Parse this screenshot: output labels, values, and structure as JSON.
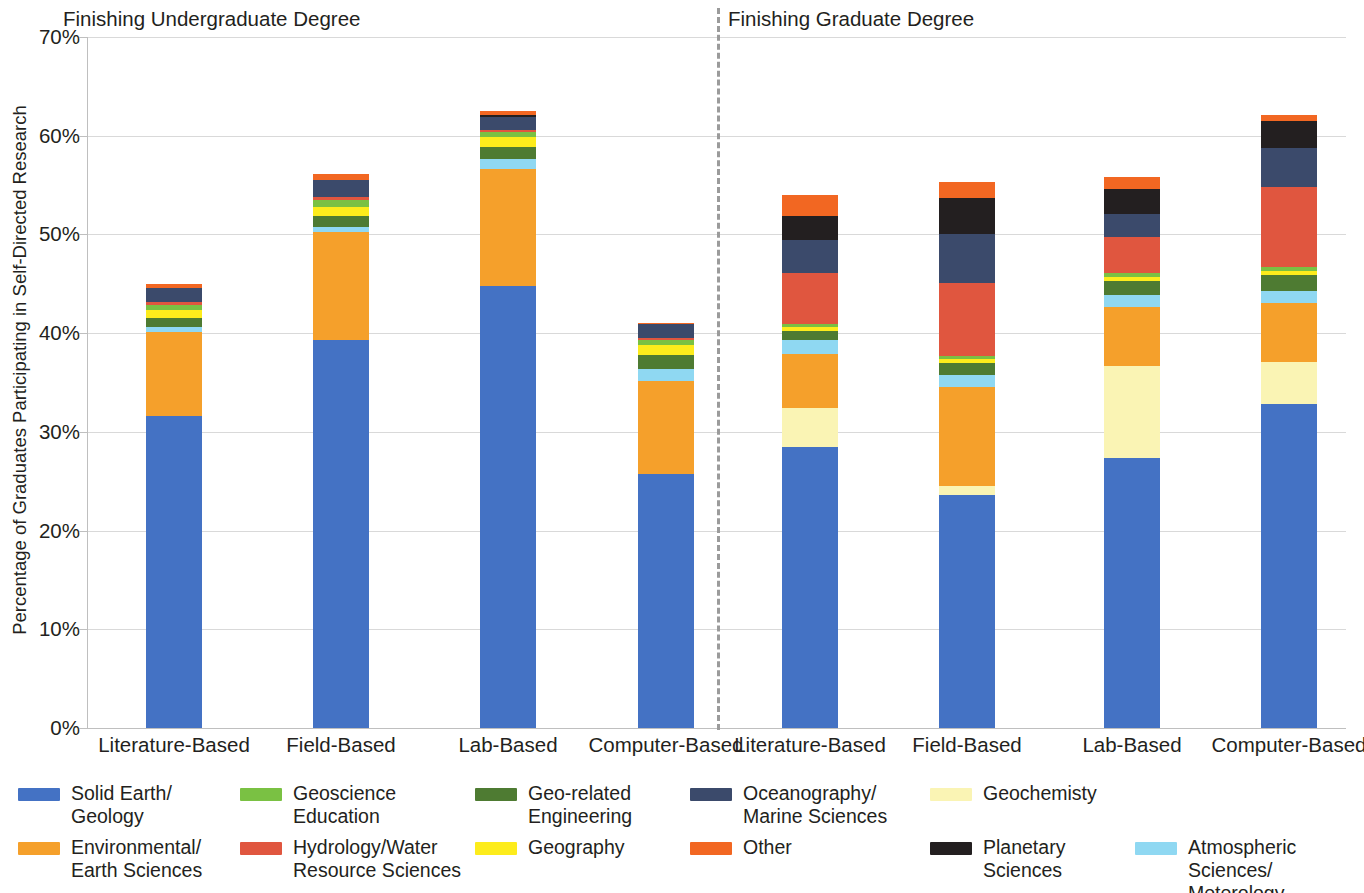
{
  "axis": {
    "y_title": "Percentage of Graduates Participating in Self-Directed Research",
    "y_ticks": [
      "0%",
      "10%",
      "20%",
      "30%",
      "40%",
      "50%",
      "60%",
      "70%"
    ]
  },
  "sections": [
    {
      "id": "undergrad",
      "title": "Finishing Undergraduate Degree"
    },
    {
      "id": "grad",
      "title": "Finishing Graduate Degree"
    }
  ],
  "x_labels": [
    "Literature-Based",
    "Field-Based",
    "Lab-Based",
    "Computer-Based",
    "Literature-Based",
    "Field-Based",
    "Lab-Based",
    "Computer-Based"
  ],
  "legend": [
    {
      "label": "Solid Earth/\nGeology",
      "color": "#4472c4"
    },
    {
      "label": "Geoscience\nEducation",
      "color": "#7ac143"
    },
    {
      "label": "Geo-related\nEngineering",
      "color": "#4e7b32"
    },
    {
      "label": "Oceanography/\nMarine Sciences",
      "color": "#3b4a6b"
    },
    {
      "label": "Geochemisty",
      "color": "#faf4b4"
    },
    {
      "label": "Environmental/\nEarth Sciences",
      "color": "#f5a02b"
    },
    {
      "label": "Hydrology/Water\nResource Sciences",
      "color": "#e0563f"
    },
    {
      "label": "Geography",
      "color": "#fdec1c"
    },
    {
      "label": "Other",
      "color": "#f26722"
    },
    {
      "label": "Planetary\nSciences",
      "color": "#231f20"
    },
    {
      "label": "Atmospheric Sciences/\nMeterology",
      "color": "#8fd8f2"
    }
  ],
  "chart_data": {
    "type": "bar",
    "stacked": true,
    "title": "",
    "subtitle": "",
    "xlabel": "",
    "ylabel": "Percentage of Graduates Participating in Self-Directed Research",
    "ylim": [
      0,
      70
    ],
    "yticks": [
      0,
      10,
      20,
      30,
      40,
      50,
      60,
      70
    ],
    "ytick_labels": [
      "0%",
      "10%",
      "20%",
      "30%",
      "40%",
      "50%",
      "60%",
      "70%"
    ],
    "grid": "horizontal",
    "legend_position": "bottom",
    "groups": [
      "Finishing Undergraduate Degree",
      "Finishing Graduate Degree"
    ],
    "categories": [
      "Literature-Based",
      "Field-Based",
      "Lab-Based",
      "Computer-Based",
      "Literature-Based",
      "Field-Based",
      "Lab-Based",
      "Computer-Based"
    ],
    "series": [
      {
        "name": "Solid Earth/Geology",
        "color": "#4472c4",
        "values": [
          31.6,
          39.3,
          44.8,
          25.7,
          28.5,
          23.6,
          27.4,
          32.8
        ]
      },
      {
        "name": "Geochemisty",
        "color": "#faf4b4",
        "values": [
          0.0,
          0.0,
          0.0,
          0.0,
          3.9,
          0.9,
          9.3,
          4.3
        ]
      },
      {
        "name": "Environmental/Earth Sciences",
        "color": "#f5a02b",
        "values": [
          8.5,
          10.9,
          11.8,
          9.5,
          5.5,
          10.0,
          6.0,
          6.0
        ]
      },
      {
        "name": "Atmospheric Sciences/Meterology",
        "color": "#8fd8f2",
        "values": [
          0.5,
          0.6,
          1.0,
          1.2,
          1.4,
          1.3,
          1.2,
          1.2
        ]
      },
      {
        "name": "Geo-related Engineering",
        "color": "#4e7b32",
        "values": [
          0.9,
          1.1,
          1.3,
          1.4,
          0.9,
          1.2,
          1.4,
          1.6
        ]
      },
      {
        "name": "Geography",
        "color": "#fdec1c",
        "values": [
          0.8,
          0.9,
          1.0,
          1.0,
          0.4,
          0.4,
          0.4,
          0.4
        ]
      },
      {
        "name": "Geoscience Education",
        "color": "#7ac143",
        "values": [
          0.6,
          0.7,
          0.5,
          0.5,
          0.3,
          0.3,
          0.4,
          0.4
        ]
      },
      {
        "name": "Hydrology/Water Resource Sciences",
        "color": "#e0563f",
        "values": [
          0.3,
          0.3,
          0.2,
          0.2,
          5.2,
          7.4,
          3.6,
          8.1
        ]
      },
      {
        "name": "Oceanography/Marine Sciences",
        "color": "#3b4a6b",
        "values": [
          1.4,
          1.7,
          1.3,
          1.4,
          3.3,
          5.0,
          2.4,
          4.0
        ]
      },
      {
        "name": "Planetary Sciences",
        "color": "#231f20",
        "values": [
          0.0,
          0.0,
          0.2,
          0.0,
          2.5,
          3.6,
          2.5,
          2.7
        ]
      },
      {
        "name": "Other",
        "color": "#f26722",
        "values": [
          0.4,
          0.6,
          0.4,
          0.1,
          2.1,
          1.6,
          1.2,
          0.6
        ]
      }
    ],
    "totals": [
      45.0,
      56.1,
      62.5,
      41.0,
      54.0,
      55.3,
      55.8,
      62.1
    ]
  },
  "layout": {
    "bar_x": [
      146,
      313,
      480,
      638,
      782,
      939,
      1104,
      1261
    ],
    "bar_width": 56,
    "px_per_percent": 9.8714,
    "plot_left": 88,
    "plot_top": 37,
    "plot_height": 691,
    "divider_x": 717,
    "section_header_x": [
      63,
      728
    ],
    "legend_cols_x": [
      18,
      240,
      475,
      690,
      930
    ],
    "legend_rows_y": [
      0,
      54
    ]
  }
}
